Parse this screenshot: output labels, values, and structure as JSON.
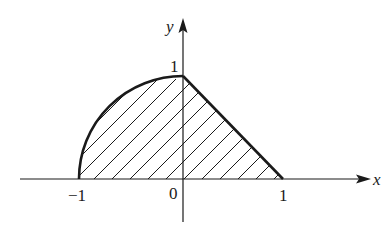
{
  "figure": {
    "axes": {
      "x_label": "x",
      "y_label": "y",
      "origin_label": "0"
    },
    "ticks": {
      "x_neg_one": "−1",
      "x_one": "1",
      "y_one": "1"
    },
    "region": {
      "left_boundary": "curved arc from (-1,0) to (0,1)",
      "right_boundary": "straight line from (0,1) to (1,0)",
      "fill": "diagonal hatching"
    },
    "colors": {
      "stroke": "#1a1a1a",
      "background": "#ffffff"
    }
  }
}
